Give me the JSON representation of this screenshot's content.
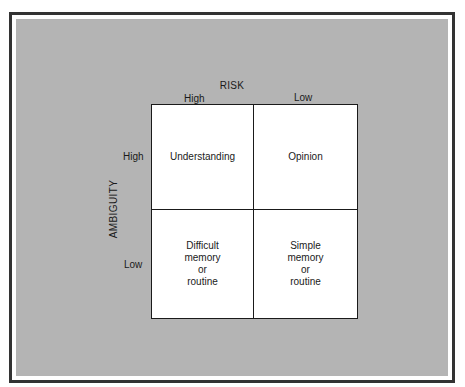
{
  "diagram": {
    "type": "2x2 matrix",
    "x_axis": {
      "title": "RISK",
      "labels": [
        "High",
        "Low"
      ]
    },
    "y_axis": {
      "title": "AMBIGUITY",
      "labels": [
        "High",
        "Low"
      ]
    },
    "cells": [
      {
        "risk": "High",
        "ambiguity": "High",
        "label": "Understanding"
      },
      {
        "risk": "Low",
        "ambiguity": "High",
        "label": "Opinion"
      },
      {
        "risk": "High",
        "ambiguity": "Low",
        "label": "Difficult\nmemory\nor\nroutine"
      },
      {
        "risk": "Low",
        "ambiguity": "Low",
        "label": "Simple\nmemory\nor\nroutine"
      }
    ]
  },
  "colors": {
    "panel_background": "#b4b4b4",
    "frame_border": "#333333",
    "cell_background": "#ffffff"
  }
}
